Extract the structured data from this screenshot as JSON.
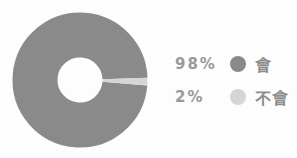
{
  "chart_data": {
    "type": "pie",
    "style": "donut",
    "title": "",
    "categories": [
      "會",
      "不會"
    ],
    "values": [
      98,
      2
    ],
    "unit": "%",
    "colors": [
      "#8a8a8a",
      "#d5d5d5"
    ],
    "inner_radius_ratio": 0.33,
    "start_angle_deg": 4.7,
    "legend_position": "right"
  },
  "legend": {
    "items": [
      {
        "percent": "98%",
        "label": "會",
        "color": "#8a8a8a"
      },
      {
        "percent": "2%",
        "label": "不會",
        "color": "#d5d5d5"
      }
    ]
  }
}
